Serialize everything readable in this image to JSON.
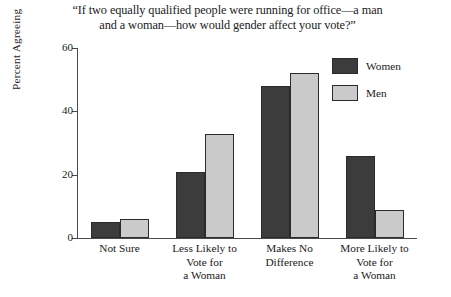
{
  "chart_data": {
    "type": "bar",
    "title": "“If two equally qualified people were running for office—a man\nand a woman—how would gender affect your vote?”",
    "xlabel": "",
    "ylabel": "Percent Agreeing",
    "ylim": [
      0,
      60
    ],
    "yticks": [
      0,
      20,
      40,
      60
    ],
    "ytick_labels": [
      "0",
      "20",
      "40",
      "60"
    ],
    "grid": false,
    "legend_position": "top-right",
    "categories": [
      "Not Sure",
      "Less Likely to\nVote for\na Woman",
      "Makes No\nDifference",
      "More Likely to\nVote for\na Woman"
    ],
    "series": [
      {
        "name": "Women",
        "color": "#3c3c3c",
        "values": [
          5,
          21,
          48,
          26
        ]
      },
      {
        "name": "Men",
        "color": "#cacaca",
        "values": [
          6,
          33,
          52,
          9
        ]
      }
    ]
  },
  "legend": {
    "items": [
      {
        "label": "Women",
        "color": "#3c3c3c"
      },
      {
        "label": "Men",
        "color": "#cacaca"
      }
    ]
  }
}
